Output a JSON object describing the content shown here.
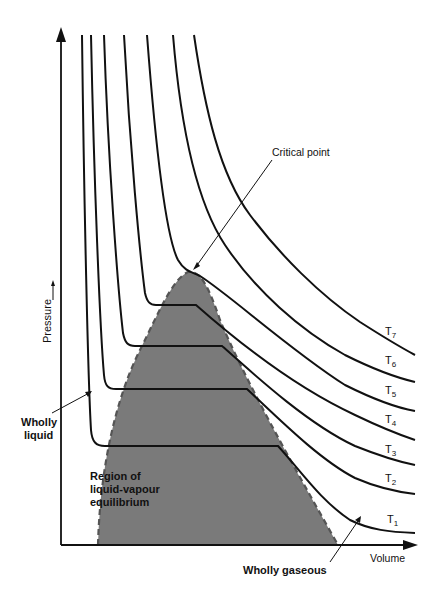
{
  "diagram": {
    "axes": {
      "x_label": "Volume",
      "y_label": "Pressure"
    },
    "labels": {
      "critical_point": "Critical point",
      "wholly_liquid_line1": "Wholly",
      "wholly_liquid_line2": "liquid",
      "wholly_gaseous": "Wholly gaseous",
      "region_line1": "Region of",
      "region_line2": "liquid-vapour",
      "region_line3": "equilibrium"
    },
    "isotherms": [
      {
        "name": "T",
        "sub": "1"
      },
      {
        "name": "T",
        "sub": "2"
      },
      {
        "name": "T",
        "sub": "3"
      },
      {
        "name": "T",
        "sub": "4"
      },
      {
        "name": "T",
        "sub": "5"
      },
      {
        "name": "T",
        "sub": "6"
      },
      {
        "name": "T",
        "sub": "7"
      }
    ],
    "colors": {
      "line": "#111111",
      "region_fill": "#7a7a7a",
      "region_border": "#555555",
      "background": "#ffffff"
    }
  }
}
